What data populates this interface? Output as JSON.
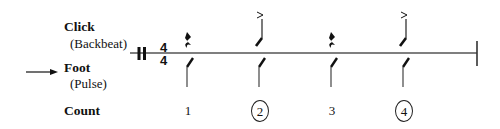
{
  "labels": {
    "click": "Click",
    "click_sub": "(Backbeat)",
    "foot": "Foot",
    "foot_sub": "(Pulse)",
    "count": "Count"
  },
  "time_signature": {
    "top": "4",
    "bottom": "4"
  },
  "beats": [
    {
      "count": "1",
      "circled": false,
      "click": "rest",
      "foot": "slash"
    },
    {
      "count": "2",
      "circled": true,
      "click": "accented-slash",
      "foot": "slash"
    },
    {
      "count": "3",
      "circled": false,
      "click": "rest",
      "foot": "slash"
    },
    {
      "count": "4",
      "circled": true,
      "click": "accented-slash",
      "foot": "slash"
    }
  ],
  "pointer": {
    "target": "Foot",
    "icon": "right-arrow-icon"
  },
  "colors": {
    "ink": "#111111",
    "staff": "#555555",
    "background": "#ffffff"
  }
}
